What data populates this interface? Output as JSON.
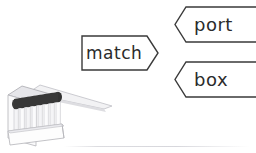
{
  "canvas": {
    "width": 256,
    "height": 153,
    "background": "#ffffff"
  },
  "diagram": {
    "stem": {
      "label": "match",
      "shape": "right-pointing-flag",
      "text_color": "#2b2b2b",
      "outline_color": "#3a3a3a",
      "fill_color": "#ffffff"
    },
    "branches": [
      {
        "label": "port",
        "shape": "left-notched-flag",
        "position": "upper-right",
        "text_color": "#2b2b2b",
        "outline_color": "#3a3a3a",
        "fill_color": "#ffffff"
      },
      {
        "label": "box",
        "shape": "left-notched-flag",
        "position": "lower-right",
        "text_color": "#2b2b2b",
        "outline_color": "#3a3a3a",
        "fill_color": "#ffffff"
      }
    ]
  },
  "illustration": {
    "name": "matchbook",
    "description": "book of matches drawn in perspective with dark match heads and an open cover flap",
    "match_head_color": "#3b3b3b",
    "stick_color": "#e9e9ec",
    "cover_color": "#d6d6da",
    "outline_color": "#9a9a9f"
  },
  "divider": {
    "color": "#dcdce0"
  }
}
